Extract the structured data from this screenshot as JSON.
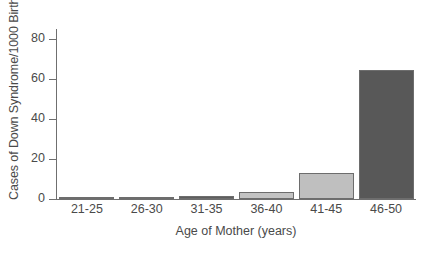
{
  "chart_data": {
    "type": "bar",
    "title": "",
    "xlabel": "Age of Mother (years)",
    "ylabel": "Cases of Down Syndrome/1000 Births",
    "categories": [
      "21-25",
      "26-30",
      "31-35",
      "36-40",
      "41-45",
      "46-50"
    ],
    "values": [
      0.7,
      0.8,
      1.5,
      3.5,
      13,
      64.5
    ],
    "ylim": [
      0,
      85
    ],
    "yticks": [
      0,
      20,
      40,
      60,
      80
    ],
    "ytick_labels": [
      "0",
      "20",
      "40",
      "60",
      "80"
    ],
    "grid": false,
    "legend": false,
    "bar_colors": [
      "#d8d8d8",
      "#595959",
      "#5e5e5e",
      "#c3c3c3",
      "#bfbfbf",
      "#585858"
    ],
    "bar_edge_color": "#6d6d6d",
    "axis_color": "#6f6f6f",
    "text_color": "#4a4a4a",
    "background": "#ffffff"
  },
  "axes": {
    "y_title": "Cases of Down Syndrome/1000 Births",
    "x_title": "Age of Mother (years)"
  },
  "caption": {
    "remnant": ""
  }
}
